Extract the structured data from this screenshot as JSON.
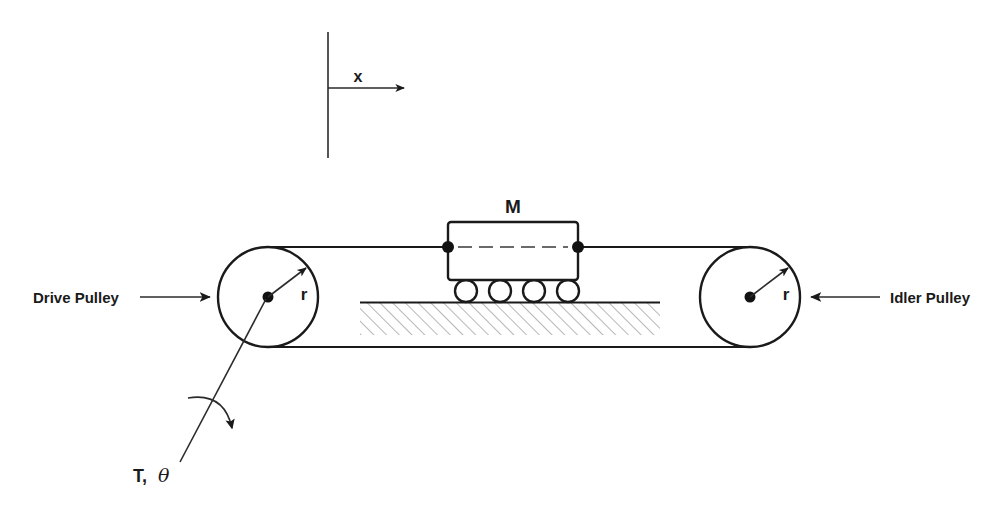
{
  "figure": {
    "type": "engineering-schematic",
    "background_color": "#ffffff",
    "line_color": "#1a1a1a",
    "hatch_color": "#7a7a7a"
  },
  "labels": {
    "drive_pulley": "Drive Pulley",
    "idler_pulley": "Idler Pulley",
    "mass": "M",
    "radius_left": "r",
    "radius_right": "r",
    "axis_x": "x",
    "torque": "T,",
    "theta": "θ"
  },
  "geometry": {
    "axis": {
      "vertical_line": {
        "x": 328,
        "y_top": 32,
        "y_bottom": 158
      },
      "horizontal_arrow": {
        "x_start": 328,
        "x_end": 408,
        "y": 88
      },
      "label_position": {
        "x": 358,
        "y": 80
      }
    },
    "left_pulley": {
      "cx": 268,
      "cy": 297,
      "r": 50,
      "hub_r": 5.5
    },
    "right_pulley": {
      "cx": 750,
      "cy": 297,
      "r": 50,
      "hub_r": 5.5
    },
    "belt": {
      "top_y": 247,
      "bottom_y": 347,
      "left_x": 268,
      "right_x": 750
    },
    "mass_box": {
      "x": 448,
      "y": 222,
      "width": 130,
      "height": 58
    },
    "attachment_dots": [
      {
        "x": 448,
        "y": 247,
        "r": 6
      },
      {
        "x": 578,
        "y": 247,
        "r": 6
      }
    ],
    "wheels": [
      {
        "cx": 466,
        "cy": 291,
        "r": 11
      },
      {
        "cx": 500,
        "cy": 291,
        "r": 11
      },
      {
        "cx": 534,
        "cy": 291,
        "r": 11
      },
      {
        "cx": 568,
        "cy": 291,
        "r": 11
      }
    ],
    "ground": {
      "x": 360,
      "y": 302,
      "width": 300,
      "height": 33
    },
    "drive_pulley_arrow": {
      "x_start": 140,
      "x_end": 213,
      "y": 297
    },
    "idler_pulley_arrow": {
      "x_start": 880,
      "x_end": 808,
      "y": 297
    },
    "torque_leader": {
      "x_start": 178,
      "y_start": 462,
      "x_end": 268,
      "y_end": 297
    },
    "torque_curve_arrow_tip": {
      "x": 232,
      "y": 434
    }
  },
  "elements": {
    "pulley_count": 2,
    "wheel_count": 4
  }
}
